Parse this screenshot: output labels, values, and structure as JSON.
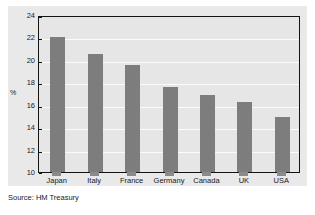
{
  "chart_data": {
    "type": "bar",
    "title": "",
    "subtitle": "",
    "xlabel": "",
    "ylabel": "%",
    "categories": [
      "Japan",
      "Italy",
      "France",
      "Germany",
      "Canada",
      "UK",
      "USA"
    ],
    "values": [
      22.0,
      20.5,
      19.5,
      17.6,
      16.9,
      16.2,
      14.9
    ],
    "series": [
      {
        "name": "",
        "values": [
          22.0,
          20.5,
          19.5,
          17.6,
          16.9,
          16.2,
          14.9
        ]
      }
    ],
    "ylim": [
      10,
      24
    ],
    "ytick_labels": [
      "24",
      "22",
      "20",
      "18",
      "16",
      "14",
      "12",
      "10"
    ],
    "ytick_values": [
      24,
      22,
      20,
      18,
      16,
      14,
      12,
      10
    ],
    "ytick_step": 2,
    "grid": true,
    "grid_orientation": "horizontal",
    "legend": false,
    "legend_position": "none",
    "annotations": [],
    "bar_color": "#7d7d7d",
    "plot_background": "#e6e6e6",
    "canvas_background": "#e9e9e9",
    "gridline_color": "#fbfbfb",
    "axis_color": "#141414"
  },
  "source": {
    "text": "Source: HM Treasury"
  }
}
